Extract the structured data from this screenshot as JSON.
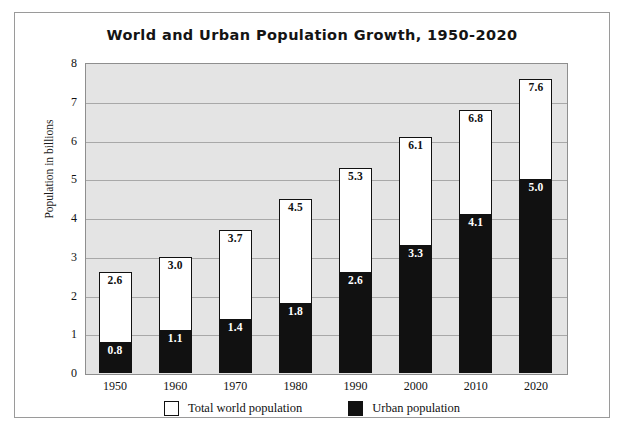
{
  "chart_data": {
    "type": "bar",
    "title": "World and Urban Population Growth, 1950-2020",
    "xlabel": "",
    "ylabel": "Population in billions",
    "ylim": [
      0,
      8
    ],
    "yticks": [
      "0",
      "1",
      "2",
      "3",
      "4",
      "5",
      "6",
      "7",
      "8"
    ],
    "grid": true,
    "legend_position": "bottom",
    "stacked": false,
    "note": "Each year shows an outer white bar (total world population) with an inner black bar (urban population) drawn from the baseline and overlapping the lower part of the white bar.",
    "categories": [
      "1950",
      "1960",
      "1970",
      "1980",
      "1990",
      "2000",
      "2010",
      "2020"
    ],
    "series": [
      {
        "name": "Total world population",
        "color": "#ffffff",
        "values": [
          2.6,
          3.0,
          3.7,
          4.5,
          5.3,
          6.1,
          6.8,
          7.6
        ],
        "labels": [
          "2.6",
          "3.0",
          "3.7",
          "4.5",
          "5.3",
          "6.1",
          "6.8",
          "7.6"
        ]
      },
      {
        "name": "Urban population",
        "color": "#111111",
        "values": [
          0.8,
          1.1,
          1.4,
          1.8,
          2.6,
          3.3,
          4.1,
          5.0
        ],
        "labels": [
          "0.8",
          "1.1",
          "1.4",
          "1.8",
          "2.6",
          "3.3",
          "4.1",
          "5.0"
        ]
      }
    ]
  },
  "legend": {
    "items": [
      {
        "label": "Total world population",
        "swatch": "white"
      },
      {
        "label": "Urban population",
        "swatch": "black"
      }
    ]
  },
  "caption_strip": ""
}
